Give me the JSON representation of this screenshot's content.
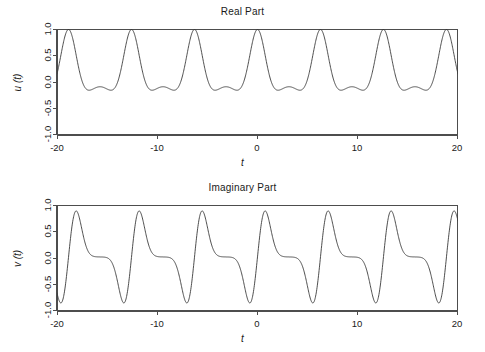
{
  "figure": {
    "background": "#ffffff",
    "line_color": "#3a3a3a",
    "axis_color": "#4d4d4d",
    "text_color": "#1a1a1a"
  },
  "chart_data": [
    {
      "id": "real",
      "type": "line",
      "title": "Real Part",
      "xlabel": "t",
      "ylabel": "u (t)",
      "xlim": [
        -20,
        20
      ],
      "ylim": [
        -1.0,
        1.0
      ],
      "xticks": [
        -20,
        -10,
        0,
        10,
        20
      ],
      "xticklabels": [
        "-20",
        "-10",
        "0",
        "10",
        "20"
      ],
      "yticks": [
        -1.0,
        -0.5,
        0.0,
        0.5,
        1.0
      ],
      "yticklabels": [
        "-1.0",
        "-0.5",
        "0.0",
        "0.5",
        "1.0"
      ],
      "grid": false,
      "legend": null,
      "period": 6.2832,
      "description": "Periodic pulse train, period 2*pi, main peak +1.0 at t = 0, +/-2pi, +/-4pi ...; troughs near -0.30; a small secondary bump near -0.10 midway between peaks",
      "series": [
        {
          "name": "u(t)",
          "color": "#3a3a3a",
          "peaks_t": [
            -18.85,
            -12.57,
            -6.28,
            0.0,
            6.28,
            12.57,
            18.85
          ],
          "peak_value": 1.0,
          "trough_value": -0.3,
          "secondary_bump_value": -0.1,
          "x_start": -20.0,
          "y_start": -0.04,
          "x_end": 20.0,
          "y_end": -0.12
        }
      ]
    },
    {
      "id": "imaginary",
      "type": "line",
      "title": "Imaginary Part",
      "xlabel": "t",
      "ylabel": "v (t)",
      "xlim": [
        -20,
        20
      ],
      "ylim": [
        -1.0,
        1.0
      ],
      "xticks": [
        -20,
        -10,
        0,
        10,
        20
      ],
      "xticklabels": [
        "-20",
        "-10",
        "0",
        "10",
        "20"
      ],
      "yticks": [
        -1.0,
        -0.5,
        0.0,
        0.5,
        1.0
      ],
      "yticklabels": [
        "-1.0",
        "-0.5",
        "0.0",
        "0.5",
        "1.0"
      ],
      "grid": false,
      "legend": null,
      "period": 6.2832,
      "description": "Periodic asymmetric oscillation, period 2*pi, minima about -0.75 just before each multiple of 2*pi, maxima about +0.75 just after, then a flat plateau close to 0.0",
      "series": [
        {
          "name": "v(t)",
          "color": "#3a3a3a",
          "minima_t": [
            -19.4,
            -13.2,
            -6.9,
            -0.6,
            5.7,
            12.0,
            18.3
          ],
          "maxima_t": [
            -18.0,
            -11.7,
            -5.4,
            0.75,
            7.0,
            13.3,
            19.6
          ],
          "min_value": -0.75,
          "max_value": 0.75,
          "plateau_value": 0.02,
          "x_start": -20.0,
          "y_start": -0.52,
          "x_end": 20.0,
          "y_end": 0.62
        }
      ]
    }
  ]
}
